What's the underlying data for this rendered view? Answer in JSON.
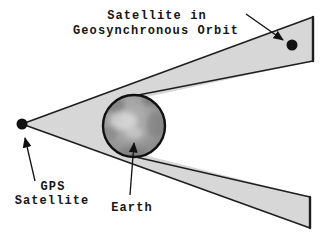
{
  "diagram": {
    "labels": {
      "geo_satellite_line1": "Satellite in",
      "geo_satellite_line2": "Geosynchronous Orbit",
      "gps_satellite_line1": "GPS",
      "gps_satellite_line2": "Satellite",
      "earth": "Earth"
    },
    "colors": {
      "background": "#ffffff",
      "beam_fill": "#d7d7d7",
      "beam_edge": "#1f1f1f",
      "earth_outline": "#101010",
      "satellite_dot": "#121212",
      "arrow": "#101010",
      "text": "#161616"
    }
  }
}
